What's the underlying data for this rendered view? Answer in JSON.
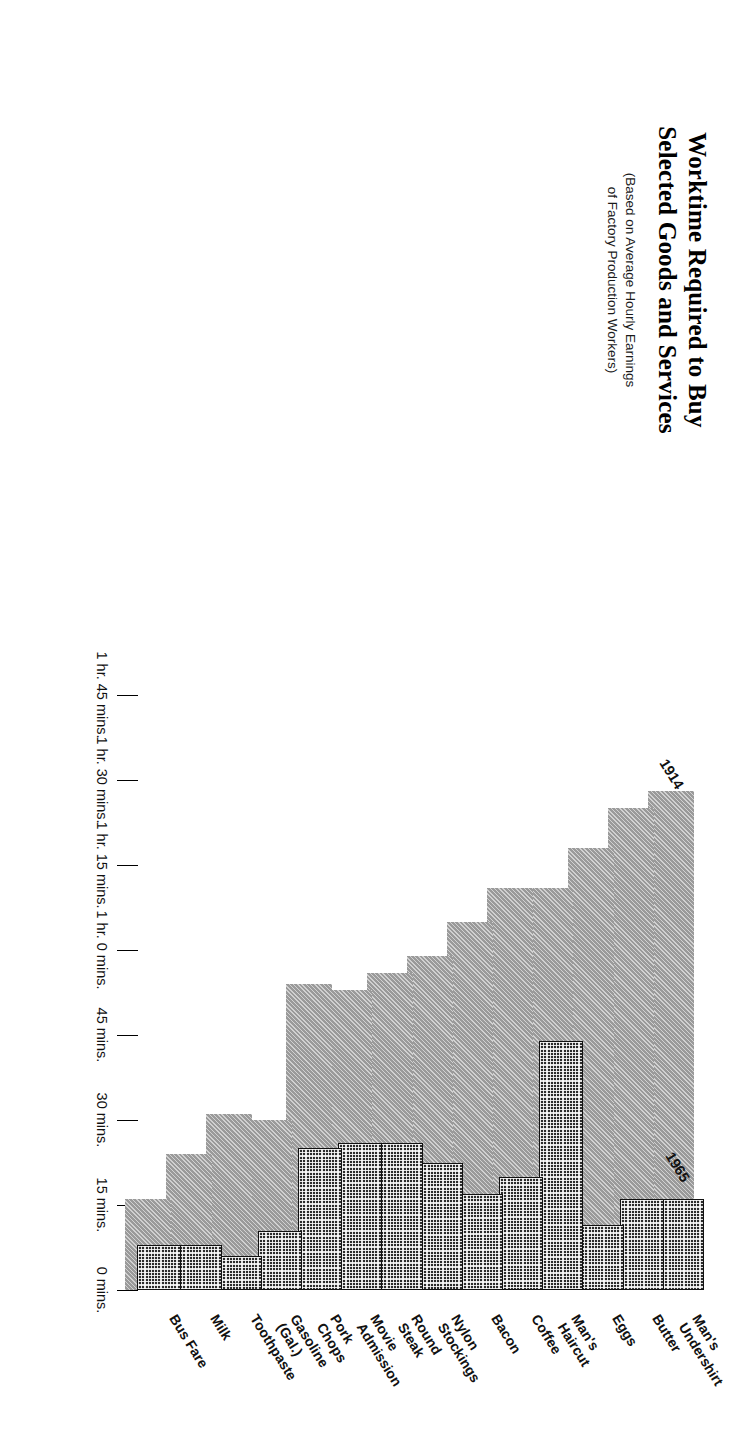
{
  "header": {
    "title": "Worktime Required to Buy\nSelected Goods and Services",
    "title_line1": "Worktime Required to Buy",
    "title_line2": "Selected Goods and Services",
    "subtitle": "(Based on Average Hourly Earnings\nof Factory Production Workers)",
    "subtitle_line1": "(Based on Average Hourly Earnings",
    "subtitle_line2": "of Factory Production Workers)"
  },
  "annotations": {
    "series_a_label": "1914",
    "series_b_label": "1965"
  },
  "chart_data": {
    "type": "bar",
    "orientation": "horizontal",
    "title": "Worktime Required to Buy Selected Goods and Services",
    "subtitle": "(Based on Average Hourly Earnings of Factory Production Workers)",
    "xlabel": "",
    "ylabel": "",
    "xlim": [
      0,
      105
    ],
    "xunit": "minutes",
    "grid": false,
    "legend_position": "inline-annotation",
    "tick_values": [
      105,
      90,
      75,
      60,
      45,
      30,
      15,
      0
    ],
    "tick_labels": [
      "1 hr. 45 mins.",
      "1 hr. 30 mins.",
      "1 hr. 15 mins.",
      "1 hr. 0 mins.",
      "45 mins.",
      "30 mins.",
      "15 mins.",
      "0 mins."
    ],
    "categories": [
      "Man's\nUndershirt",
      "Butter",
      "Eggs",
      "Man's\nHaircut",
      "Coffee",
      "Bacon",
      "Nylon\nStockings",
      "Round\nSteak",
      "Movie\nAdmission",
      "Pork\nChops",
      "Gasoline\n(Gal.)",
      "Toothpaste",
      "Milk",
      "Bus Fare"
    ],
    "series": [
      {
        "name": "1914",
        "color": "#9a9a9a",
        "values": [
          88,
          85,
          78,
          71,
          71,
          65,
          59,
          56,
          53,
          54,
          30,
          31,
          24,
          16
        ]
      },
      {
        "name": "1965",
        "color": "#2b2b2b",
        "values": [
          16,
          16,
          11.5,
          44,
          20,
          17,
          22.5,
          26,
          26,
          25,
          10.5,
          6,
          8,
          8
        ]
      }
    ]
  }
}
